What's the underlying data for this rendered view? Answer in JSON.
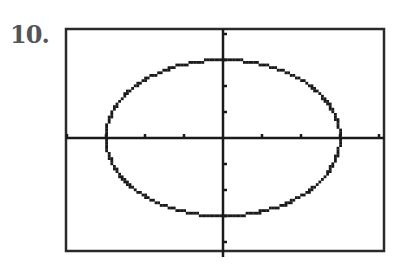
{
  "problem": {
    "number_label": "10."
  },
  "graph": {
    "frame": {
      "left": 66,
      "top": 29,
      "right": 384,
      "bottom": 251,
      "stroke": "#2a2a2a"
    },
    "origin": {
      "x": 223,
      "y": 138
    },
    "unit": {
      "x": 39,
      "y": 26
    },
    "x_ticks": [
      -4,
      -3,
      -2,
      -1,
      1,
      2,
      3,
      4
    ],
    "y_ticks": [
      -4,
      -3,
      -2,
      -1,
      1,
      2,
      3,
      4
    ],
    "curve": {
      "type": "ellipse",
      "equation": "x^2 + y^2 = 9",
      "rx_units": 3,
      "ry_units": 3,
      "color": "#1a1a1a"
    }
  },
  "chart_data": {
    "type": "line",
    "title": "",
    "xlabel": "",
    "ylabel": "",
    "xlim": [
      -4.1,
      4.1
    ],
    "ylim": [
      -4.1,
      4.1
    ],
    "grid": false,
    "series": [
      {
        "name": "x^2 + y^2 = 9",
        "shape": "circle",
        "center": [
          0,
          0
        ],
        "radius": 3
      }
    ]
  }
}
